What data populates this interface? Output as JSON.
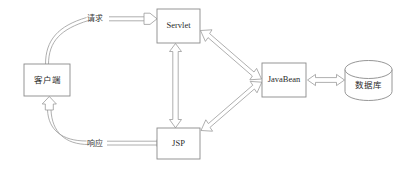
{
  "diagram": {
    "background_color": "#ffffff",
    "line_color": "#8a8a8a",
    "text_color": "#2b2b2b",
    "nodes": [
      {
        "id": "client",
        "label": "客户端",
        "shape": "rectangle",
        "x": 24,
        "y": 64,
        "w": 46,
        "h": 32
      },
      {
        "id": "servlet",
        "label": "Servlet",
        "shape": "rectangle",
        "x": 157,
        "y": 9,
        "w": 43,
        "h": 34
      },
      {
        "id": "jsp",
        "label": "JSP",
        "shape": "rectangle",
        "x": 157,
        "y": 128,
        "w": 43,
        "h": 31
      },
      {
        "id": "javabean",
        "label": "JavaBean",
        "shape": "rectangle",
        "x": 262,
        "y": 63,
        "w": 44,
        "h": 34
      },
      {
        "id": "database",
        "label": "数据库",
        "shape": "cylinder",
        "x": 345,
        "y": 60,
        "w": 47,
        "h": 41
      }
    ],
    "edges": [
      {
        "id": "client-to-servlet",
        "label": "请求",
        "from": "client",
        "to": "servlet",
        "style": "curved-then-block-arrow",
        "direction": "one-way"
      },
      {
        "id": "jsp-to-client",
        "label": "响应",
        "from": "jsp",
        "to": "client",
        "style": "curved-then-block-arrow",
        "direction": "one-way"
      },
      {
        "id": "servlet-jsp",
        "label": "",
        "from": "servlet",
        "to": "jsp",
        "style": "vertical-block-arrow",
        "direction": "two-way"
      },
      {
        "id": "servlet-javabean",
        "label": "",
        "from": "servlet",
        "to": "javabean",
        "style": "diagonal-block-arrow",
        "direction": "two-way"
      },
      {
        "id": "jsp-javabean",
        "label": "",
        "from": "jsp",
        "to": "javabean",
        "style": "diagonal-block-arrow",
        "direction": "two-way"
      },
      {
        "id": "javabean-database",
        "label": "",
        "from": "javabean",
        "to": "database",
        "style": "horizontal-block-arrow",
        "direction": "two-way"
      }
    ],
    "edge_labels": {
      "request": "请求",
      "response": "响应"
    }
  }
}
